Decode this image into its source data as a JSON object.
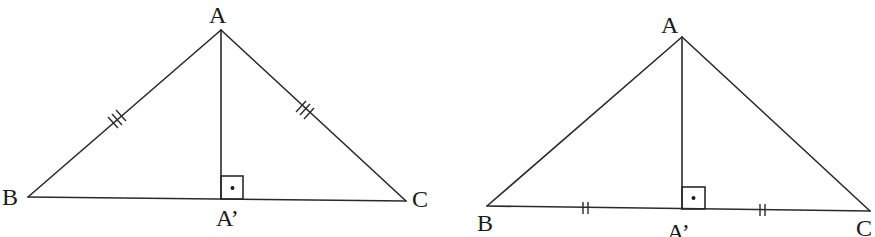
{
  "figures": [
    {
      "name": "isosceles-triangle-equal-sides",
      "labels": {
        "A": "A",
        "B": "B",
        "C": "C",
        "foot": "A’"
      },
      "marks": "AB and AC marked with triple ticks; AA' perpendicular to BC (right angle with dot)"
    },
    {
      "name": "triangle-equal-base-segments",
      "labels": {
        "A": "A",
        "B": "B",
        "C": "C",
        "foot": "A’"
      },
      "marks": "BA' and A'C marked with double ticks; AA' perpendicular to BC (right angle with dot)"
    }
  ]
}
